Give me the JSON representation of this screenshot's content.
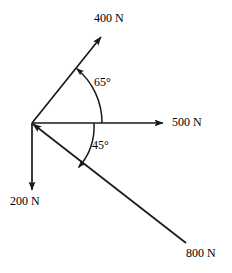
{
  "figure": {
    "type": "force-vector-diagram",
    "background_color": "#ffffff",
    "stroke_color": "#1a1a1a",
    "text_color": "#000000",
    "origin": {
      "x": 32,
      "y": 123
    }
  },
  "vectors": [
    {
      "id": "force-400",
      "label": "400 N",
      "magnitude": 400,
      "unit": "N",
      "direction": "up-right",
      "arrow_at": "tip",
      "angle_from_positive_x_deg": 51,
      "tip": {
        "x": 102,
        "y": 36
      },
      "label_position": {
        "x": 94,
        "y": 12
      }
    },
    {
      "id": "force-500",
      "label": "500 N",
      "magnitude": 500,
      "unit": "N",
      "direction": "right",
      "arrow_at": "tip",
      "angle_from_positive_x_deg": 0,
      "tip": {
        "x": 164,
        "y": 123
      },
      "label_position": {
        "x": 172,
        "y": 116
      }
    },
    {
      "id": "force-200",
      "label": "200 N",
      "magnitude": 200,
      "unit": "N",
      "direction": "down",
      "arrow_at": "tip",
      "angle_from_positive_x_deg": -90,
      "tip": {
        "x": 32,
        "y": 191
      },
      "label_position": {
        "x": 10,
        "y": 195
      }
    },
    {
      "id": "force-800",
      "label": "800 N",
      "magnitude": 800,
      "unit": "N",
      "direction": "toward-origin-from-lower-right",
      "arrow_at": "origin",
      "angle_from_positive_x_deg": -45,
      "tail": {
        "x": 186,
        "y": 243
      },
      "label_position": {
        "x": 186,
        "y": 247
      }
    }
  ],
  "angles": [
    {
      "id": "angle-65",
      "label": "65°",
      "value": 65,
      "unit": "degrees",
      "between": [
        "force-500",
        "force-400"
      ],
      "arc_radius": 70,
      "arrow_at": "force-400-side",
      "label_position": {
        "x": 94,
        "y": 76
      }
    },
    {
      "id": "angle-45",
      "label": "45°",
      "value": 45,
      "unit": "degrees",
      "between": [
        "force-500",
        "force-800"
      ],
      "arc_radius": 62,
      "arrow_at": "force-800-side",
      "label_position": {
        "x": 92,
        "y": 139
      }
    }
  ]
}
